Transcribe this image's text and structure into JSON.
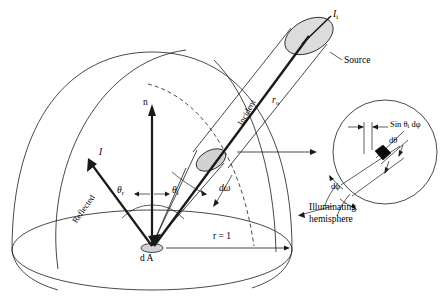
{
  "figure": {
    "title_visible": false,
    "background_color": "#ffffff",
    "stroke_color": "#1a1a1a",
    "fill_gray": "#dcdcdc",
    "patch_gray": "#d2d2d2"
  },
  "labels": {
    "source_radiance": "I",
    "source_radiance_sub": "i",
    "source": "Source",
    "incident": "Incident",
    "distance": "r",
    "distance_sub": "o",
    "normal": "n",
    "reflected_vector": "I",
    "reflected": "Reflected",
    "theta_r": "θ",
    "theta_r_sub": "r",
    "theta_i": "θ",
    "theta_i_sub": "i",
    "solid_angle": "dω",
    "hemisphere_line1": "Illuminating",
    "hemisphere_line2": "hemisphere",
    "radius": "r = 1",
    "area_element": "d A",
    "inset_arc_width": "Sin θ",
    "inset_arc_width_sub": "i",
    "inset_arc_width_tail": " dφ",
    "inset_dtheta": "dθ",
    "inset_dphi": "dφ"
  },
  "icons": {
    "connector": "arrow-right-icon",
    "normal_vector": "arrow-up-icon",
    "reflected_vector": "arrow-upleft-icon",
    "incident_vector": "arrow-upright-icon"
  },
  "geometry": {
    "hemisphere_center_x": 152,
    "hemisphere_center_y": 252,
    "hemisphere_radius_x": 140,
    "hemisphere_radius_y": 28,
    "inset_center_x": 385,
    "inset_center_y": 152,
    "inset_radius": 52
  }
}
